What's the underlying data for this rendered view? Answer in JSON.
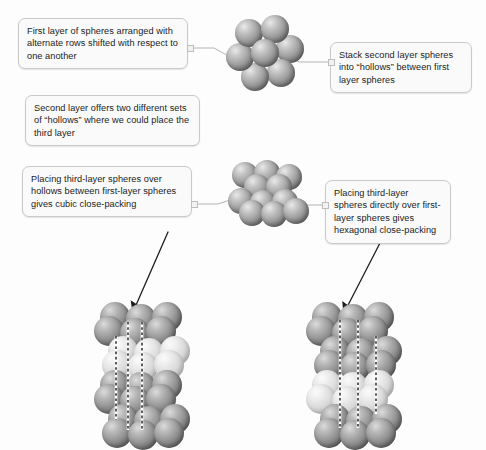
{
  "figure": {
    "background_color": "#fdfdfd",
    "sphere_color": "#9d9d9d",
    "sphere_light_color": "#d8d8d8",
    "callout_fill": "#fafafa",
    "callout_border": "#c9c9c9",
    "line_color": "#b4b4b4",
    "arrow_color": "#1a1a1a"
  },
  "callouts": [
    {
      "id": "first-layer",
      "text": "First layer of spheres arranged with alternate rows shifted with respect to one another"
    },
    {
      "id": "second-layer-stack",
      "text": "Stack second layer spheres into “hollows” between first layer spheres"
    },
    {
      "id": "second-layer-hollows",
      "text": "Second layer offers two different sets of  “hollows” where we could place the third layer"
    },
    {
      "id": "cubic-close-packing",
      "text": "Placing third-layer spheres over hollows between first-layer spheres gives cubic close-packing"
    },
    {
      "id": "hexagonal-close-packing",
      "text": "Placing third-layer spheres directly over first-layer spheres gives hexagonal close-packing"
    }
  ],
  "clusters": [
    {
      "id": "single-layer-hexagon",
      "label": "first layer seven-sphere hexagonal arrangement",
      "sphere_count": 7
    },
    {
      "id": "two-layer-stack",
      "label": "two-layer stack of spheres",
      "sphere_count": 11
    },
    {
      "id": "ccp-stack",
      "label": "cubic close-packed four-layer stack",
      "layers": 4
    },
    {
      "id": "hcp-stack",
      "label": "hexagonal close-packed four-layer stack",
      "layers": 4
    }
  ]
}
